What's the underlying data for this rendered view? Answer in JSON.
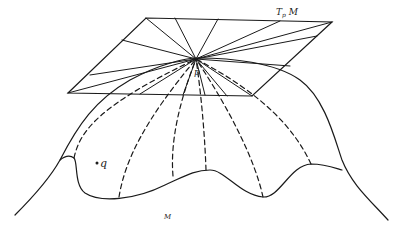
{
  "diagram": {
    "type": "tangent-plane-illustration",
    "labels": {
      "tangent_plane": "T",
      "tangent_plane_sub": "p",
      "tangent_plane_manifold": "M",
      "point_p": "p",
      "point_q": "q",
      "manifold": "M"
    },
    "colors": {
      "stroke": "#1a1a1a",
      "background": "#ffffff"
    }
  }
}
